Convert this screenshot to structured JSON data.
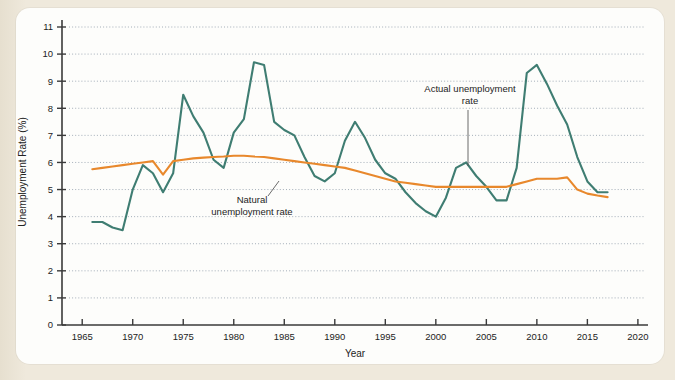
{
  "figure": {
    "panel_bg": "#fdfdfb",
    "page_bg": "#efe9dc"
  },
  "chart_data": {
    "type": "line",
    "title": "",
    "xlabel": "Year",
    "ylabel": "Unemployment Rate (%)",
    "xlim": [
      1963,
      2021
    ],
    "ylim": [
      0,
      11
    ],
    "xticks": [
      1965,
      1970,
      1975,
      1980,
      1985,
      1990,
      1995,
      2000,
      2005,
      2010,
      2015,
      2020
    ],
    "yticks": [
      0,
      1,
      2,
      3,
      4,
      5,
      6,
      7,
      8,
      9,
      10,
      11
    ],
    "grid": "horizontal-dotted",
    "legend": "none",
    "annotations": [
      {
        "name": "actual-unemployment-rate",
        "text_line1": "Actual unemployment",
        "text_line2": "rate",
        "text_x": 470,
        "text_y": 92,
        "leader_from_x": 468,
        "leader_from_y": 110,
        "leader_to_x": 468,
        "leader_to_y": 166
      },
      {
        "name": "natural-unemployment-rate",
        "text_line1": "Natural",
        "text_line2": "unemployment rate",
        "text_x": 252,
        "text_y": 203,
        "leader_from_x": 268,
        "leader_from_y": 196,
        "leader_to_x": 279,
        "leader_to_y": 181
      }
    ],
    "series": [
      {
        "name": "Actual unemployment rate",
        "color": "#3f7d72",
        "stroke_width": 2.1,
        "x": [
          1966,
          1967,
          1968,
          1969,
          1970,
          1971,
          1972,
          1973,
          1974,
          1975,
          1976,
          1977,
          1978,
          1979,
          1980,
          1981,
          1982,
          1983,
          1984,
          1985,
          1986,
          1987,
          1988,
          1989,
          1990,
          1991,
          1992,
          1993,
          1994,
          1995,
          1996,
          1997,
          1998,
          1999,
          2000,
          2001,
          2002,
          2003,
          2004,
          2005,
          2006,
          2007,
          2008,
          2009,
          2010,
          2011,
          2012,
          2013,
          2014,
          2015,
          2016,
          2017
        ],
        "values": [
          3.8,
          3.8,
          3.6,
          3.5,
          5.0,
          5.9,
          5.6,
          4.9,
          5.6,
          8.5,
          7.7,
          7.1,
          6.1,
          5.8,
          7.1,
          7.6,
          9.7,
          9.6,
          7.5,
          7.2,
          7.0,
          6.2,
          5.5,
          5.3,
          5.6,
          6.8,
          7.5,
          6.9,
          6.1,
          5.6,
          5.4,
          4.9,
          4.5,
          4.2,
          4.0,
          4.7,
          5.8,
          6.0,
          5.5,
          5.1,
          4.6,
          4.6,
          5.8,
          9.3,
          9.6,
          8.9,
          8.1,
          7.4,
          6.2,
          5.3,
          4.9,
          4.9
        ]
      },
      {
        "name": "Natural unemployment rate",
        "color": "#e8882c",
        "stroke_width": 2.1,
        "x": [
          1966,
          1967,
          1968,
          1969,
          1970,
          1971,
          1972,
          1973,
          1974,
          1975,
          1976,
          1977,
          1978,
          1979,
          1980,
          1981,
          1982,
          1983,
          1984,
          1985,
          1986,
          1987,
          1988,
          1989,
          1990,
          1991,
          1992,
          1993,
          1994,
          1995,
          1996,
          1997,
          1998,
          1999,
          2000,
          2001,
          2002,
          2003,
          2004,
          2005,
          2006,
          2007,
          2008,
          2009,
          2010,
          2011,
          2012,
          2013,
          2014,
          2015,
          2016,
          2017
        ],
        "values": [
          5.75,
          5.8,
          5.85,
          5.9,
          5.95,
          6.0,
          6.05,
          5.55,
          6.05,
          6.1,
          6.15,
          6.18,
          6.2,
          6.22,
          6.25,
          6.25,
          6.22,
          6.2,
          6.15,
          6.1,
          6.05,
          6.0,
          5.95,
          5.9,
          5.85,
          5.8,
          5.7,
          5.6,
          5.5,
          5.4,
          5.3,
          5.25,
          5.2,
          5.15,
          5.1,
          5.1,
          5.1,
          5.1,
          5.1,
          5.1,
          5.1,
          5.1,
          5.2,
          5.3,
          5.4,
          5.4,
          5.4,
          5.45,
          5.0,
          4.85,
          4.78,
          4.72
        ]
      }
    ]
  }
}
